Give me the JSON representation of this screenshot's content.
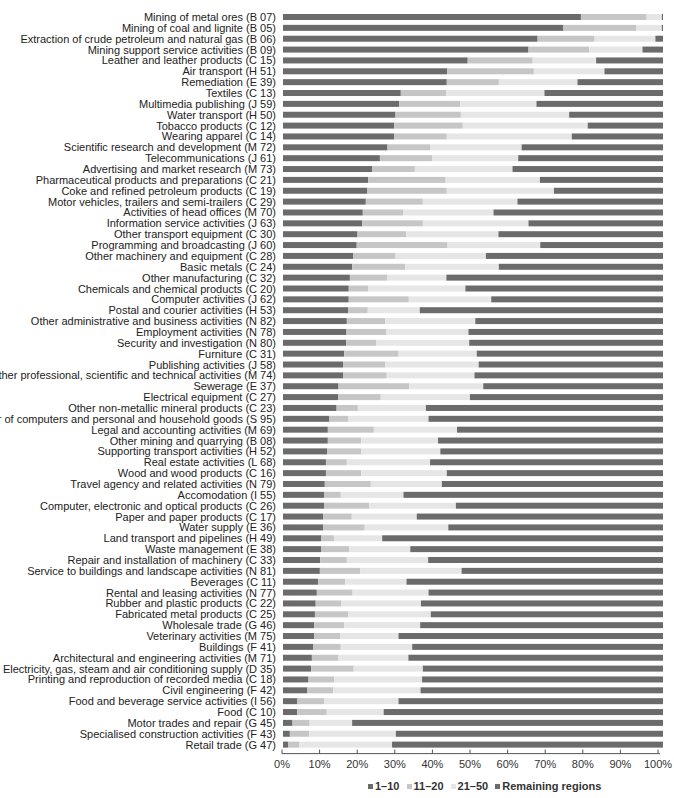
{
  "chart_data": {
    "type": "bar",
    "orientation": "horizontal",
    "stacked": true,
    "normalized": true,
    "title": "",
    "xlabel": "",
    "ylabel": "",
    "xlim": [
      0,
      100
    ],
    "x_ticks": [
      "0%",
      "10%",
      "20%",
      "30%",
      "40%",
      "50%",
      "60%",
      "70%",
      "80%",
      "90%",
      "100%"
    ],
    "grid": false,
    "legend_position": "bottom",
    "categories": [
      "Mining of metal ores (B 07)",
      "Mining of coal and lignite (B 05)",
      "Extraction of crude petroleum and natural gas (B 06)",
      "Mining support service activities (B 09)",
      "Leather and leather products (C 15)",
      "Air transport (H 51)",
      "Remediation (E 39)",
      "Textiles (C 13)",
      "Multimedia publishing (J 59)",
      "Water transport (H 50)",
      "Tobacco products (C 12)",
      "Wearing apparel (C 14)",
      "Scientific research and development (M 72)",
      "Telecommunications (J 61)",
      "Advertising and market research (M 73)",
      "Pharmaceutical products and preparations (C 21)",
      "Coke and refined petroleum products (C 19)",
      "Motor vehicles, trailers and semi-trailers (C 29)",
      "Activities of head offices (M 70)",
      "Information service activities (J 63)",
      "Other transport equipment (C 30)",
      "Programming and broadcasting (J 60)",
      "Other machinery and equipment (C 28)",
      "Basic metals (C 24)",
      "Other manufacturing (C 32)",
      "Chemicals and chemical products (C 20)",
      "Computer activities (J 62)",
      "Postal and courier activities (H 53)",
      "Other administrative and business activities (N 82)",
      "Employment activities (N 78)",
      "Security and investigation (N 80)",
      "Furniture (C 31)",
      "Publishing activities (J 58)",
      "Other professional, scientific and technical activities (M 74)",
      "Sewerage (E 37)",
      "Electrical equipment (C 27)",
      "Other non-metallic mineral products (C 23)",
      "Repair of computers and personal and household goods (S 95)",
      "Legal and accounting activities (M 69)",
      "Other mining and quarrying (B 08)",
      "Supporting transport activities (H 52)",
      "Real estate activities (L 68)",
      "Wood and wood products (C 16)",
      "Travel agency and related activities (N 79)",
      "Accomodation (I 55)",
      "Computer, electronic and optical products (C 26)",
      "Paper and paper products (C 17)",
      "Water supply (E 36)",
      "Land transport and pipelines (H 49)",
      "Waste management (E 38)",
      "Repair and installation of machinery (C 33)",
      "Service to buildings and landscape activities (N 81)",
      "Beverages (C 11)",
      "Rental and leasing activities (N 77)",
      "Rubber and plastic products (C 22)",
      "Fabricated metal products (C 25)",
      "Wholesale trade (G 46)",
      "Veterinary activities (M 75)",
      "Buildings (F 41)",
      "Architectural and engineering activities (M 71)",
      "Electricity, gas, steam and air conditioning supply (D 35)",
      "Printing and reproduction of recorded media (C 18)",
      "Civil engineering (F 42)",
      "Food and beverage service activities (I 56)",
      "Food (C 10)",
      "Motor trades and repair (G 45)",
      "Specialised construction activities (F 43)",
      "Retail trade (G 47)"
    ],
    "series": [
      {
        "name": "1-10",
        "legend_label": "1–10",
        "color": "#6b6b6b",
        "values": [
          78.4,
          73.8,
          67.0,
          64.6,
          48.6,
          43.2,
          43.1,
          31.0,
          30.6,
          29.6,
          29.3,
          29.3,
          27.5,
          25.5,
          23.5,
          22.4,
          22.2,
          21.8,
          21.0,
          20.8,
          19.6,
          19.4,
          18.5,
          18.2,
          17.6,
          17.3,
          17.3,
          17.1,
          16.8,
          16.7,
          16.6,
          16.1,
          15.8,
          15.8,
          14.6,
          14.5,
          14.1,
          12.2,
          11.8,
          11.8,
          11.6,
          11.3,
          11.3,
          11.0,
          10.9,
          10.8,
          10.6,
          10.6,
          10.1,
          10.0,
          9.8,
          9.7,
          9.2,
          8.9,
          8.6,
          8.4,
          8.2,
          8.2,
          8.0,
          7.6,
          7.4,
          6.7,
          6.4,
          3.8,
          3.7,
          2.5,
          1.8,
          1.4
        ]
      },
      {
        "name": "11-20",
        "legend_label": "11–20",
        "color": "#c6c6c6",
        "values": [
          17.3,
          19.1,
          15.0,
          16.0,
          17.1,
          22.8,
          13.7,
          11.9,
          16.0,
          17.2,
          18.0,
          13.8,
          11.2,
          13.7,
          11.2,
          20.4,
          20.9,
          15.0,
          10.7,
          16.0,
          12.8,
          23.9,
          11.1,
          14.0,
          9.9,
          5.1,
          15.8,
          5.2,
          10.1,
          10.4,
          8.0,
          14.3,
          11.1,
          11.5,
          18.6,
          11.2,
          5.6,
          4.9,
          12.1,
          8.8,
          9.0,
          5.5,
          9.3,
          12.1,
          4.3,
          11.9,
          7.5,
          10.9,
          3.3,
          7.4,
          7.0,
          10.6,
          7.2,
          9.4,
          6.8,
          8.8,
          7.9,
          6.8,
          7.2,
          7.0,
          11.2,
          6.8,
          6.8,
          7.0,
          7.8,
          4.5,
          5.1,
          2.9
        ]
      },
      {
        "name": "21-50",
        "legend_label": "21–50",
        "color": "#e6e6e6",
        "values": [
          4.0,
          6.8,
          16.0,
          14.0,
          16.7,
          18.6,
          20.7,
          25.9,
          20.1,
          28.5,
          32.9,
          32.9,
          24.1,
          22.7,
          25.7,
          24.8,
          28.2,
          24.9,
          23.7,
          27.8,
          24.3,
          24.4,
          23.8,
          24.6,
          15.5,
          25.6,
          21.7,
          13.7,
          23.7,
          21.7,
          24.4,
          20.6,
          24.6,
          23.1,
          19.5,
          23.5,
          17.9,
          21.2,
          21.9,
          20.2,
          20.8,
          21.9,
          22.5,
          18.7,
          16.5,
          22.8,
          17.1,
          22.0,
          12.7,
          16.1,
          21.4,
          26.7,
          16.1,
          20.0,
          20.9,
          21.7,
          20.0,
          15.4,
          18.8,
          18.4,
          18.2,
          23.1,
          23.0,
          19.6,
          15.0,
          11.2,
          22.8,
          24.4
        ]
      },
      {
        "name": "Remaining regions",
        "legend_label": "Remaining regions",
        "color": "#6b6b6b",
        "values": [
          0.3,
          0.3,
          2.0,
          5.4,
          17.6,
          15.4,
          22.5,
          31.2,
          33.3,
          24.7,
          19.8,
          24.0,
          37.2,
          38.1,
          39.6,
          32.4,
          28.7,
          38.3,
          44.6,
          35.4,
          43.3,
          32.3,
          46.6,
          43.2,
          57.0,
          52.0,
          45.2,
          64.0,
          49.4,
          51.2,
          51.0,
          49.0,
          48.5,
          49.6,
          47.3,
          50.8,
          62.4,
          61.7,
          54.2,
          59.2,
          58.6,
          61.3,
          56.9,
          58.2,
          68.3,
          54.5,
          64.8,
          56.5,
          73.9,
          66.5,
          61.8,
          53.0,
          67.5,
          61.7,
          63.7,
          61.1,
          63.9,
          69.6,
          66.0,
          67.0,
          63.2,
          63.4,
          63.8,
          69.6,
          73.5,
          81.8,
          70.3,
          71.3
        ]
      }
    ]
  },
  "legend": {
    "items": [
      {
        "label": "1–10",
        "color": "#6b6b6b"
      },
      {
        "label": "11–20",
        "color": "#c6c6c6"
      },
      {
        "label": "21–50",
        "color": "#e6e6e6"
      },
      {
        "label": "Remaining regions",
        "color": "#6b6b6b"
      }
    ]
  }
}
